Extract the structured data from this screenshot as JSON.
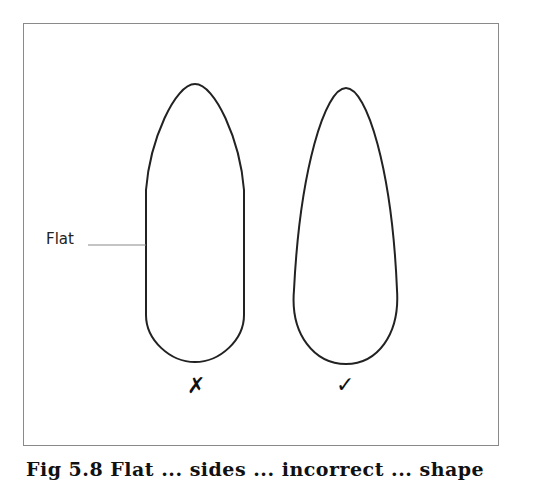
{
  "figure": {
    "label_flat": "Flat",
    "mark_wrong": "✗",
    "mark_right": "✓",
    "caption": "Fig 5.8 Flat ... sides ... incorrect ... shape",
    "shapes": [
      {
        "name": "incorrect-shape",
        "description": "elongated shape with flat straight sides"
      },
      {
        "name": "correct-shape",
        "description": "smooth tapered teardrop shape"
      }
    ],
    "colors": {
      "stroke": "#222222",
      "frame": "#8a8a8a",
      "leader": "#888888"
    }
  }
}
